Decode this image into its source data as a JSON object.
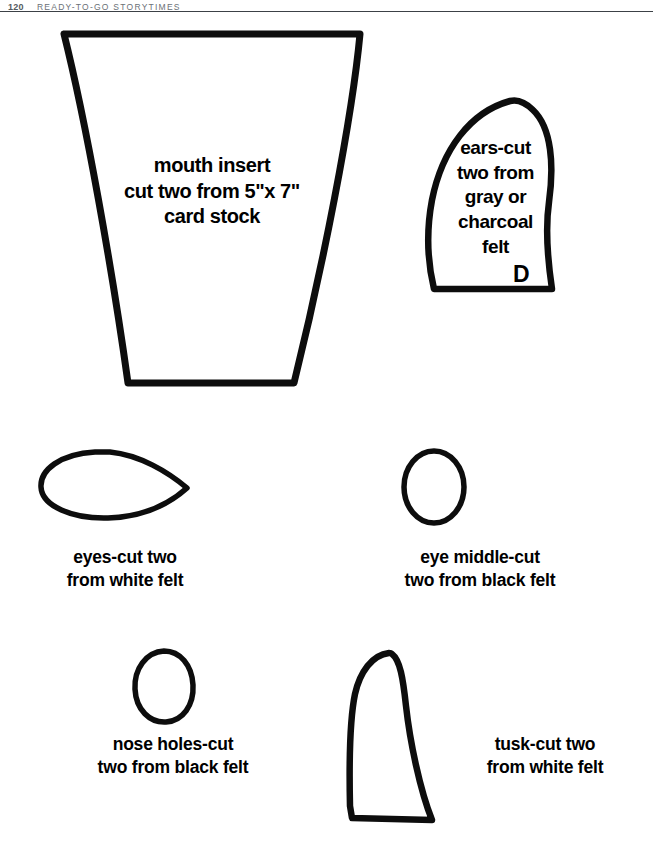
{
  "page": {
    "width": 653,
    "height": 854,
    "background_color": "#ffffff",
    "ink_color": "#0d0d0d"
  },
  "running_head": {
    "folio": "120",
    "title": "READY-TO-GO STORYTIMES",
    "rule_color": "#3c4146"
  },
  "patterns": [
    {
      "id": "mouth-insert",
      "shape": "trapezoid",
      "caption": "mouth insert\ncut two from 5\"x 7\"\ncard stock",
      "label": ""
    },
    {
      "id": "ears",
      "shape": "ear-leaf",
      "caption": "ears-cut\ntwo from\ngray or\ncharcoal\nfelt",
      "label": "D"
    },
    {
      "id": "eyes",
      "shape": "teardrop",
      "caption": "eyes-cut two\nfrom white felt",
      "label": ""
    },
    {
      "id": "eye-middle",
      "shape": "oval",
      "caption": "eye middle-cut\ntwo from black felt",
      "label": ""
    },
    {
      "id": "nose-holes",
      "shape": "oval",
      "caption": "nose holes-cut\ntwo from black felt",
      "label": ""
    },
    {
      "id": "tusk",
      "shape": "tusk",
      "caption": "tusk-cut two\nfrom white felt",
      "label": ""
    }
  ]
}
